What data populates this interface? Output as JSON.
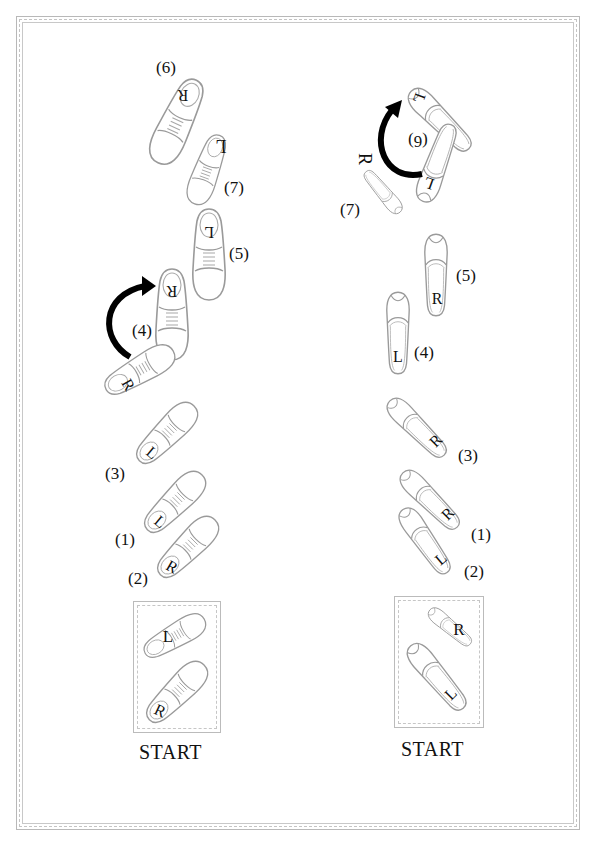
{
  "diagram": {
    "colors": {
      "shoe_outline": "#9a9a9a",
      "arrow": "#000000",
      "text": "#111111",
      "frame": "#bbbbbb"
    },
    "left_panel": {
      "type": "men's dress shoes",
      "start_label": "START",
      "start_feet": [
        {
          "foot": "L"
        },
        {
          "foot": "R"
        }
      ],
      "steps": [
        {
          "label": "(1)",
          "foot": "L"
        },
        {
          "label": "(2)",
          "foot": "R"
        },
        {
          "label": "(3)",
          "foot": "L"
        },
        {
          "label": "(4)",
          "foot": "R",
          "turn_arrow": true
        },
        {
          "label": "(5)",
          "foot": "L"
        },
        {
          "label": "(6)",
          "foot": "R"
        },
        {
          "label": "(7)",
          "foot": "L"
        }
      ]
    },
    "right_panel": {
      "type": "women's heels",
      "start_label": "START",
      "start_feet": [
        {
          "foot": "R"
        },
        {
          "foot": "L"
        }
      ],
      "steps": [
        {
          "label": "(1)",
          "foot": "R"
        },
        {
          "label": "(2)",
          "foot": "L"
        },
        {
          "label": "(3)",
          "foot": "R"
        },
        {
          "label": "(4)",
          "foot": "L"
        },
        {
          "label": "(5)",
          "foot": "R"
        },
        {
          "label": "(6)",
          "foot": "L",
          "turn_arrow": true
        },
        {
          "label": "(7)",
          "foot": "R"
        }
      ]
    }
  }
}
